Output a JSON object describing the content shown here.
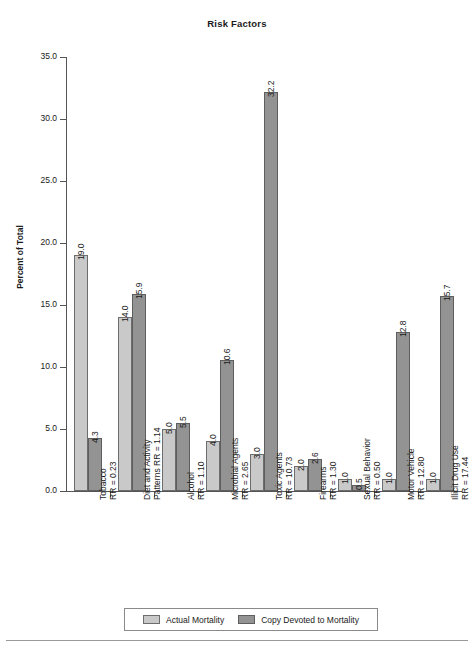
{
  "chart_data": {
    "type": "bar",
    "title": "Risk Factors",
    "xlabel": "",
    "ylabel": "Percent of Total",
    "ylim": [
      0.0,
      35.0
    ],
    "ytick_labels": [
      "0.0",
      "5.0",
      "10.0",
      "15.0",
      "20.0",
      "25.0",
      "30.0",
      "35.0"
    ],
    "ytick_values": [
      0.0,
      5.0,
      10.0,
      15.0,
      20.0,
      25.0,
      30.0,
      35.0
    ],
    "grid": false,
    "legend_position": "bottom",
    "categories": [
      "Tobacco",
      "Diet and Activity Patterns",
      "Alcohol",
      "Microbial Agents",
      "Toxic Agents",
      "Firearms",
      "Sexual Behavior",
      "Motor Vehicle",
      "Illicit Drug Use"
    ],
    "category_labels": [
      {
        "line1": "Tobacco",
        "line2": "RR = 0.23"
      },
      {
        "line1": "Diet and Activity",
        "line2": "Patterns RR = 1.14"
      },
      {
        "line1": "Alcohol",
        "line2": "RR = 1.10"
      },
      {
        "line1": "Microbial Agents",
        "line2": "RR = 2.65"
      },
      {
        "line1": "Toxic Agents",
        "line2": "RR = 10.73"
      },
      {
        "line1": "Firearms",
        "line2": "RR = 1.30"
      },
      {
        "line1": "Sexual Behavior",
        "line2": "RR = 0.50"
      },
      {
        "line1": "Motor Vehicle",
        "line2": "RR = 12.80"
      },
      {
        "line1": "Illicit Drug Use",
        "line2": "RR = 17.44"
      }
    ],
    "relative_risk": [
      0.23,
      1.14,
      1.1,
      2.65,
      10.73,
      1.3,
      0.5,
      12.8,
      17.44
    ],
    "series": [
      {
        "name": "Actual Mortality",
        "color": "#c9c9c9",
        "values": [
          19.0,
          14.0,
          5.0,
          4.0,
          3.0,
          2.0,
          1.0,
          1.0,
          1.0
        ],
        "labels": [
          "19.0",
          "14.0",
          "5.0",
          "4.0",
          "3.0",
          "2.0",
          "1.0",
          "1.0",
          "1.0"
        ]
      },
      {
        "name": "Copy Devoted to Mortality",
        "color": "#939393",
        "values": [
          4.3,
          15.9,
          5.5,
          10.6,
          32.2,
          2.6,
          0.5,
          12.8,
          15.7
        ],
        "labels": [
          "4.3",
          "15.9",
          "5.5",
          "10.6",
          "32.2",
          "2.6",
          "0.5",
          "12.8",
          "15.7"
        ]
      }
    ]
  },
  "legend": {
    "entries": [
      {
        "label": "Actual Mortality",
        "swatch": "actual"
      },
      {
        "label": "Copy Devoted to Mortality",
        "swatch": "copy"
      }
    ]
  }
}
